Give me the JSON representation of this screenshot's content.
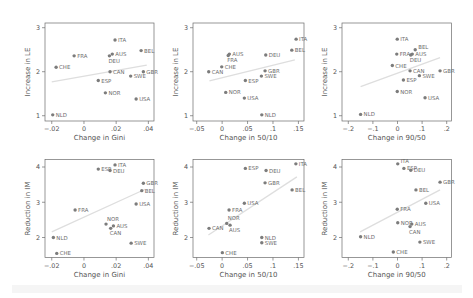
{
  "chart_data": [
    {
      "type": "scatter",
      "title": "",
      "xlabel": "Change in Gini",
      "ylabel": "Increase in LE",
      "xlim": [
        -0.0242,
        0.0435
      ],
      "ylim": [
        0.88,
        3.107
      ],
      "xticks": [
        -0.02,
        0,
        0.02,
        0.04
      ],
      "xtick_labels": [
        "−.02",
        "0",
        ".02",
        ".04"
      ],
      "yticks": [
        1,
        2,
        3
      ],
      "ytick_labels": [
        "1",
        "2",
        "3"
      ],
      "grid": false,
      "legend": null,
      "points": [
        {
          "label": "ITA",
          "x": 0.0193,
          "y": 2.72
        },
        {
          "label": "BEL",
          "x": 0.0355,
          "y": 2.48
        },
        {
          "label": "FRA",
          "x": -0.0061,
          "y": 2.36
        },
        {
          "label": "AUS",
          "x": 0.0176,
          "y": 2.4
        },
        {
          "label": "DEU",
          "x": 0.0158,
          "y": 2.36,
          "label_pos": "below"
        },
        {
          "label": "CHE",
          "x": -0.0173,
          "y": 2.1
        },
        {
          "label": "CAN",
          "x": 0.0162,
          "y": 2.0
        },
        {
          "label": "GBR",
          "x": 0.0369,
          "y": 2.0
        },
        {
          "label": "SWE",
          "x": 0.029,
          "y": 1.9
        },
        {
          "label": "ESP",
          "x": 0.0089,
          "y": 1.8
        },
        {
          "label": "NOR",
          "x": 0.0133,
          "y": 1.52
        },
        {
          "label": "USA",
          "x": 0.0324,
          "y": 1.38
        },
        {
          "label": "NLD",
          "x": -0.0194,
          "y": 1.02
        }
      ],
      "fit_line": {
        "x": [
          -0.02,
          0.039
        ],
        "y": [
          1.77,
          2.15
        ]
      }
    },
    {
      "type": "scatter",
      "title": "",
      "xlabel": "Change in 50/10",
      "ylabel": "Increase in LE",
      "xlim": [
        -0.0573,
        0.161
      ],
      "ylim": [
        0.88,
        3.107
      ],
      "xticks": [
        -0.05,
        0,
        0.05,
        0.1,
        0.15
      ],
      "xtick_labels": [
        "−.05",
        "0",
        ".05",
        ".1",
        ".15"
      ],
      "yticks": [
        1,
        2,
        3
      ],
      "ytick_labels": [
        "1",
        "2",
        "3"
      ],
      "grid": false,
      "legend": null,
      "points": [
        {
          "label": "ITA",
          "x": 0.1455,
          "y": 2.74
        },
        {
          "label": "BEL",
          "x": 0.137,
          "y": 2.49
        },
        {
          "label": "AUS",
          "x": 0.0142,
          "y": 2.4
        },
        {
          "label": "FRA",
          "x": 0.012,
          "y": 2.37,
          "label_pos": "below"
        },
        {
          "label": "DEU",
          "x": 0.0858,
          "y": 2.38
        },
        {
          "label": "CHE",
          "x": -0.0008,
          "y": 2.11
        },
        {
          "label": "CAN",
          "x": -0.0264,
          "y": 2.0
        },
        {
          "label": "GBR",
          "x": 0.0844,
          "y": 2.02
        },
        {
          "label": "SWE",
          "x": 0.0772,
          "y": 1.9
        },
        {
          "label": "ESP",
          "x": 0.0457,
          "y": 1.8
        },
        {
          "label": "NOR",
          "x": 0.0071,
          "y": 1.53
        },
        {
          "label": "USA",
          "x": 0.0437,
          "y": 1.4
        },
        {
          "label": "NLD",
          "x": 0.078,
          "y": 1.02
        }
      ],
      "fit_line": {
        "x": [
          -0.025,
          0.143
        ],
        "y": [
          1.79,
          2.27
        ]
      }
    },
    {
      "type": "scatter",
      "title": "",
      "xlabel": "Change in 90/50",
      "ylabel": "Increase in LE",
      "xlim": [
        -0.2256,
        0.2195
      ],
      "ylim": [
        0.88,
        3.107
      ],
      "xticks": [
        -0.2,
        -0.1,
        0,
        0.1,
        0.2
      ],
      "xtick_labels": [
        "−.2",
        "−.1",
        "0",
        ".1",
        ".2"
      ],
      "yticks": [
        1,
        2,
        3
      ],
      "ytick_labels": [
        "1",
        "2",
        "3"
      ],
      "grid": false,
      "legend": null,
      "points": [
        {
          "label": "ITA",
          "x": -0.001,
          "y": 2.74
        },
        {
          "label": "BEL",
          "x": 0.072,
          "y": 2.5,
          "label_pos": "above-right"
        },
        {
          "label": "FRA",
          "x": -0.003,
          "y": 2.4
        },
        {
          "label": "AUS",
          "x": 0.06,
          "y": 2.4
        },
        {
          "label": "DEU",
          "x": 0.054,
          "y": 2.38,
          "label_pos": "below"
        },
        {
          "label": "CHE",
          "x": -0.021,
          "y": 2.14
        },
        {
          "label": "CAN",
          "x": 0.051,
          "y": 2.02
        },
        {
          "label": "GBR",
          "x": 0.173,
          "y": 2.02
        },
        {
          "label": "SWE",
          "x": 0.089,
          "y": 1.91
        },
        {
          "label": "ESP",
          "x": 0.024,
          "y": 1.81
        },
        {
          "label": "NOR",
          "x": -0.001,
          "y": 1.55
        },
        {
          "label": "USA",
          "x": 0.112,
          "y": 1.41
        },
        {
          "label": "NLD",
          "x": -0.15,
          "y": 1.03
        }
      ],
      "fit_line": {
        "x": [
          -0.15,
          0.173
        ],
        "y": [
          1.66,
          2.32
        ]
      }
    },
    {
      "type": "scatter",
      "title": "",
      "xlabel": "Change in Gini",
      "ylabel": "Reduction in IM",
      "xlim": [
        -0.0242,
        0.0435
      ],
      "ylim": [
        1.433,
        4.213
      ],
      "xticks": [
        -0.02,
        0,
        0.02,
        0.04
      ],
      "xtick_labels": [
        "−.02",
        "0",
        ".02",
        ".04"
      ],
      "yticks": [
        2,
        3,
        4
      ],
      "ytick_labels": [
        "2",
        "3",
        "4"
      ],
      "grid": false,
      "legend": null,
      "points": [
        {
          "label": "ITA",
          "x": 0.0193,
          "y": 4.06
        },
        {
          "label": "ESP",
          "x": 0.0089,
          "y": 3.94
        },
        {
          "label": "DEU",
          "x": 0.0162,
          "y": 3.9
        },
        {
          "label": "GBR",
          "x": 0.0369,
          "y": 3.54
        },
        {
          "label": "BEL",
          "x": 0.0359,
          "y": 3.33
        },
        {
          "label": "USA",
          "x": 0.0324,
          "y": 2.95
        },
        {
          "label": "FRA",
          "x": -0.0055,
          "y": 2.78
        },
        {
          "label": "NOR",
          "x": 0.0137,
          "y": 2.38,
          "label_pos": "above"
        },
        {
          "label": "AUS",
          "x": 0.0183,
          "y": 2.33
        },
        {
          "label": "CAN",
          "x": 0.0166,
          "y": 2.26,
          "label_pos": "below"
        },
        {
          "label": "NLD",
          "x": -0.019,
          "y": 2.0
        },
        {
          "label": "SWE",
          "x": 0.0293,
          "y": 1.84
        },
        {
          "label": "CHE",
          "x": -0.0169,
          "y": 1.55
        }
      ],
      "fit_line": {
        "x": [
          -0.02,
          0.038
        ],
        "y": [
          2.16,
          3.37
        ]
      }
    },
    {
      "type": "scatter",
      "title": "",
      "xlabel": "Change in 50/10",
      "ylabel": "Reduction in IM",
      "xlim": [
        -0.0573,
        0.161
      ],
      "ylim": [
        1.433,
        4.213
      ],
      "xticks": [
        -0.05,
        0,
        0.05,
        0.1,
        0.15
      ],
      "xtick_labels": [
        "−.05",
        "0",
        ".05",
        ".1",
        ".15"
      ],
      "yticks": [
        2,
        3,
        4
      ],
      "ytick_labels": [
        "2",
        "3",
        "4"
      ],
      "grid": false,
      "legend": null,
      "points": [
        {
          "label": "ITA",
          "x": 0.145,
          "y": 4.09
        },
        {
          "label": "ESP",
          "x": 0.0457,
          "y": 3.96
        },
        {
          "label": "DEU",
          "x": 0.0864,
          "y": 3.9
        },
        {
          "label": "GBR",
          "x": 0.0844,
          "y": 3.55
        },
        {
          "label": "BEL",
          "x": 0.1376,
          "y": 3.35
        },
        {
          "label": "USA",
          "x": 0.0437,
          "y": 2.97
        },
        {
          "label": "FRA",
          "x": 0.0136,
          "y": 2.78
        },
        {
          "label": "NOR",
          "x": 0.009,
          "y": 2.4,
          "label_pos": "above"
        },
        {
          "label": "AUS",
          "x": 0.0156,
          "y": 2.35,
          "label_pos": "below"
        },
        {
          "label": "CAN",
          "x": -0.0258,
          "y": 2.26
        },
        {
          "label": "NLD",
          "x": 0.078,
          "y": 2.0
        },
        {
          "label": "SWE",
          "x": 0.078,
          "y": 1.85
        },
        {
          "label": "CHE",
          "x": 0.0004,
          "y": 1.57
        }
      ],
      "fit_line": {
        "x": [
          -0.027,
          0.147
        ],
        "y": [
          2.07,
          3.72
        ]
      }
    },
    {
      "type": "scatter",
      "title": "",
      "xlabel": "Change in 90/50",
      "ylabel": "Reduction in IM",
      "xlim": [
        -0.2256,
        0.2195
      ],
      "ylim": [
        1.433,
        4.213
      ],
      "xticks": [
        -0.2,
        -0.1,
        0,
        0.1,
        0.2
      ],
      "xtick_labels": [
        "−.2",
        "−.1",
        "0",
        ".1",
        ".2"
      ],
      "yticks": [
        2,
        3,
        4
      ],
      "ytick_labels": [
        "2",
        "3",
        "4"
      ],
      "grid": false,
      "legend": null,
      "points": [
        {
          "label": "ITA",
          "x": 0.001,
          "y": 4.09,
          "label_pos": "above-right"
        },
        {
          "label": "ESP",
          "x": 0.026,
          "y": 3.96
        },
        {
          "label": "DEU",
          "x": 0.054,
          "y": 3.91
        },
        {
          "label": "GBR",
          "x": 0.173,
          "y": 3.57
        },
        {
          "label": "BEL",
          "x": 0.075,
          "y": 3.35
        },
        {
          "label": "USA",
          "x": 0.115,
          "y": 2.97
        },
        {
          "label": "FRA",
          "x": -0.001,
          "y": 2.8
        },
        {
          "label": "NOR",
          "x": 0.001,
          "y": 2.42
        },
        {
          "label": "AUS",
          "x": 0.058,
          "y": 2.38
        },
        {
          "label": "CAN",
          "x": 0.051,
          "y": 2.31,
          "label_pos": "below"
        },
        {
          "label": "NLD",
          "x": -0.15,
          "y": 2.02
        },
        {
          "label": "SWE",
          "x": 0.091,
          "y": 1.87
        },
        {
          "label": "CHE",
          "x": -0.017,
          "y": 1.59
        }
      ],
      "fit_line": {
        "x": [
          -0.152,
          0.173
        ],
        "y": [
          2.16,
          3.35
        ]
      }
    }
  ]
}
